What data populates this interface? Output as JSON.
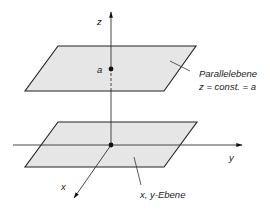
{
  "diagram": {
    "axes": {
      "z_label": "z",
      "y_label": "y",
      "x_label": "x"
    },
    "point_label": "a",
    "upper_plane": {
      "name": "Parallelebene",
      "equation": "z = const. = a"
    },
    "lower_plane": {
      "name": "x, y-Ebene"
    },
    "colors": {
      "plane_fill": "#e6e6e6",
      "stroke": "#222222"
    }
  }
}
